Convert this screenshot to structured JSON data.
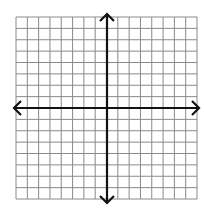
{
  "diagram": {
    "type": "coordinate-plane",
    "grid": {
      "columns": 16,
      "rows": 16,
      "left": 16,
      "top": 17,
      "right": 197,
      "bottom": 199,
      "line_color": "#8a8a8a"
    },
    "x_axis": {
      "y": 108,
      "x_start": 14,
      "x_end": 199,
      "color": "#111111",
      "arrows": "both"
    },
    "y_axis": {
      "x": 107,
      "y_start": 14,
      "y_end": 203,
      "color": "#111111",
      "arrows": "both"
    },
    "labels": []
  }
}
